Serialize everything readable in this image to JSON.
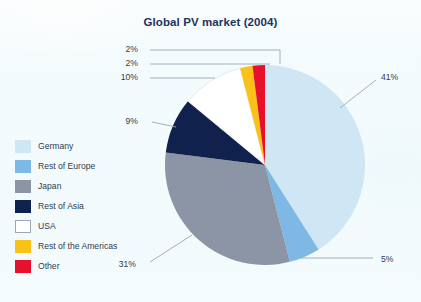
{
  "figure": {
    "background_color": "#f4fbfc"
  },
  "chart_data": {
    "type": "pie",
    "title": "Global PV market (2004)",
    "xlabel": "",
    "ylabel": "",
    "units": "percent",
    "legend_position": "left",
    "grid": false,
    "categories": [
      "Germany",
      "Rest of Europe",
      "Japan",
      "Rest of Asia",
      "USA",
      "Rest of the Americas",
      "Other"
    ],
    "values": [
      41,
      5,
      31,
      9,
      10,
      2,
      2
    ],
    "value_labels": [
      "41%",
      "5%",
      "31%",
      "9%",
      "10%",
      "2%",
      "2%"
    ],
    "colors": [
      "#cfe6f4",
      "#7eb8e4",
      "#8c95a5",
      "#10214d",
      "#ffffff",
      "#f9c218",
      "#e8112d"
    ],
    "slices": [
      {
        "label": "Germany",
        "value": 41,
        "value_label": "41%",
        "color": "#cfe6f4"
      },
      {
        "label": "Rest of Europe",
        "value": 5,
        "value_label": "5%",
        "color": "#7eb8e4"
      },
      {
        "label": "Japan",
        "value": 31,
        "value_label": "31%",
        "color": "#8c95a5"
      },
      {
        "label": "Rest of Asia",
        "value": 9,
        "value_label": "9%",
        "color": "#10214d"
      },
      {
        "label": "USA",
        "value": 10,
        "value_label": "10%",
        "color": "#ffffff"
      },
      {
        "label": "Rest of the Americas",
        "value": 2,
        "value_label": "2%",
        "color": "#f9c218"
      },
      {
        "label": "Other",
        "value": 2,
        "value_label": "2%",
        "color": "#e8112d"
      }
    ]
  },
  "legend": {
    "items": [
      {
        "label": "Germany",
        "color": "#cfe6f4",
        "bordered": false
      },
      {
        "label": "Rest of Europe",
        "color": "#7eb8e4",
        "bordered": false
      },
      {
        "label": "Japan",
        "color": "#8c95a5",
        "bordered": false
      },
      {
        "label": "Rest of Asia",
        "color": "#10214d",
        "bordered": false
      },
      {
        "label": "USA",
        "color": "#ffffff",
        "bordered": true
      },
      {
        "label": "Rest of the Americas",
        "color": "#f9c218",
        "bordered": false
      },
      {
        "label": "Other",
        "color": "#e8112d",
        "bordered": false
      }
    ]
  },
  "callouts": [
    {
      "name": "callout-other",
      "text": "2%",
      "x": 138,
      "y": 50,
      "align": "right"
    },
    {
      "name": "callout-rest-of-the-americas",
      "text": "2%",
      "x": 138,
      "y": 64,
      "align": "right"
    },
    {
      "name": "callout-usa",
      "text": "10%",
      "x": 138,
      "y": 78,
      "align": "right"
    },
    {
      "name": "callout-rest-of-asia",
      "text": "9%",
      "x": 138,
      "y": 122,
      "align": "right"
    },
    {
      "name": "callout-japan",
      "text": "31%",
      "x": 136,
      "y": 265,
      "align": "right"
    },
    {
      "name": "callout-germany",
      "text": "41%",
      "x": 381,
      "y": 78,
      "align": "left"
    },
    {
      "name": "callout-rest-of-europe",
      "text": "5%",
      "x": 381,
      "y": 260,
      "align": "left"
    }
  ],
  "geometry": {
    "center_x": 265,
    "center_y": 165,
    "radius": 100,
    "start_angle_deg": -90
  },
  "leader_line_color": "#9aa7b4"
}
